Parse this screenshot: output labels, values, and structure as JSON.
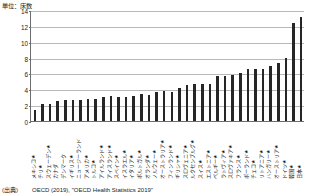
{
  "unit_label": "単位：床数",
  "source": {
    "tag": "(出典)",
    "text": "OECD (2019), \"OECD Health Statistics 2019\""
  },
  "chart_data": {
    "type": "bar",
    "title": "",
    "subtitle": "",
    "xlabel": "",
    "ylabel": "単位：床数",
    "ylim": [
      0,
      14
    ],
    "yticks": [
      0,
      2,
      4,
      6,
      8,
      10,
      12,
      14
    ],
    "grid": true,
    "legend": "none",
    "bar_color": "#262626",
    "categories": [
      "メキシコ★",
      "チリ★",
      "スウェーデン★",
      "カナダ",
      "デンマーク",
      "イギリス★",
      "ニュージーランド",
      "アメリカ★",
      "トルコ★",
      "アイルランド★",
      "アイスランド★",
      "スペイン★",
      "イスラエル★",
      "イタリア★",
      "ポルトガル★",
      "オランダ★",
      "ノルウェー★",
      "オーストラリア★",
      "フィンランド★",
      "ギリシャ★",
      "スロヴェニア★",
      "ルクセンブルグ★",
      "スイス★",
      "エストニア★",
      "ベルギー★",
      "ラトヴィア★",
      "スロヴァキア★",
      "フランス★",
      "ポーランド★",
      "チェコ★",
      "リトアニア★",
      "ハンガリー★",
      "オーストリア★",
      "ドイツ★",
      "韓国★",
      "日本★"
    ],
    "values": [
      1.4,
      2.1,
      2.2,
      2.5,
      2.6,
      2.6,
      2.7,
      2.8,
      2.8,
      3.0,
      3.1,
      3.0,
      3.0,
      3.2,
      3.4,
      3.3,
      3.6,
      3.8,
      3.6,
      4.2,
      4.5,
      4.7,
      4.7,
      4.7,
      5.7,
      5.7,
      5.8,
      6.0,
      6.6,
      6.6,
      6.6,
      7.0,
      7.3,
      8.0,
      12.3,
      13.1
    ]
  }
}
